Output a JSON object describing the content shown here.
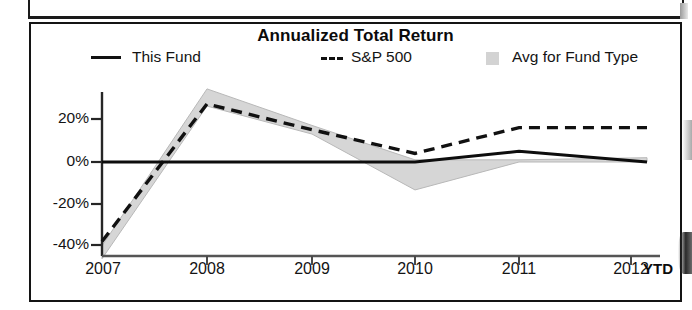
{
  "panel": {
    "title": "Annualized Total Return"
  },
  "legend": [
    {
      "label": "This Fund",
      "marker": "solid-line-swatch",
      "color": "#111111"
    },
    {
      "label": "S&P 500",
      "marker": "dashed-line-swatch",
      "color": "#111111"
    },
    {
      "label": "Avg for Fund Type",
      "marker": "gray-band-swatch",
      "color": "#d3d3d3"
    }
  ],
  "axis": {
    "y_ticks": [
      "20%",
      "0%",
      "-20%",
      "-40%"
    ],
    "x_ticks": [
      "2007",
      "2008",
      "2009",
      "2010",
      "2011",
      "2012"
    ],
    "x_suffix": "YTD"
  },
  "chart_data": {
    "type": "line",
    "title": "Annualized Total Return",
    "xlabel": "",
    "ylabel": "",
    "categories": [
      "2007",
      "2008",
      "2009",
      "2010",
      "2011",
      "2012 YTD"
    ],
    "ylim": [
      -45,
      36
    ],
    "ytick_values": [
      20,
      0,
      -20,
      -40
    ],
    "ytick_labels": [
      "20%",
      "0%",
      "-20%",
      "-40%"
    ],
    "grid": false,
    "legend_position": "top",
    "series": [
      {
        "name": "This Fund",
        "style": "solid",
        "color": "#111111",
        "values": [
          0,
          0,
          0,
          0,
          5,
          0
        ]
      },
      {
        "name": "S&P 500",
        "style": "dashed",
        "color": "#111111",
        "values": [
          -37,
          27,
          15,
          4,
          16,
          16
        ]
      },
      {
        "name": "Avg for Fund Type",
        "style": "band",
        "color": "#d3d3d3",
        "upper": [
          -39,
          34,
          17,
          1,
          1,
          2
        ],
        "lower": [
          -45,
          26,
          13,
          -13,
          0,
          0
        ]
      }
    ]
  }
}
